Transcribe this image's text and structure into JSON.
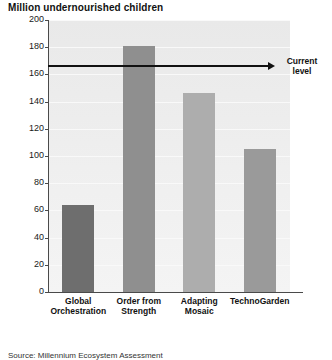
{
  "chart_data": {
    "type": "bar",
    "title": "Million undernourished children",
    "xlabel": "",
    "ylabel": "Million undernourished children",
    "ylim": [
      0,
      200
    ],
    "ytick_step": 20,
    "yticks": [
      "200",
      "180",
      "160",
      "140",
      "120",
      "100",
      "80",
      "60",
      "40",
      "20",
      "0"
    ],
    "grid": true,
    "legend": "none",
    "categories": [
      "Global Orchestration",
      "Order from Strength",
      "Adapting Mosaic",
      "TechnoGarden"
    ],
    "category_lines": [
      [
        "Global",
        "Orchestration"
      ],
      [
        "Order from",
        "Strength"
      ],
      [
        "Adapting",
        "Mosaic"
      ],
      [
        "TechnoGarden"
      ]
    ],
    "values": [
      64,
      181,
      146,
      105
    ],
    "bar_colors": [
      "#6e6e6e",
      "#8f8f8f",
      "#adadad",
      "#9a9a9a"
    ],
    "annotations": [
      {
        "name": "current-level",
        "label_lines": [
          "Current",
          "level"
        ],
        "value": 166,
        "style": "horizontal-arrow"
      }
    ],
    "source": "Source: Millennium Ecosystem Assessment",
    "plot_background": "#ececec"
  }
}
